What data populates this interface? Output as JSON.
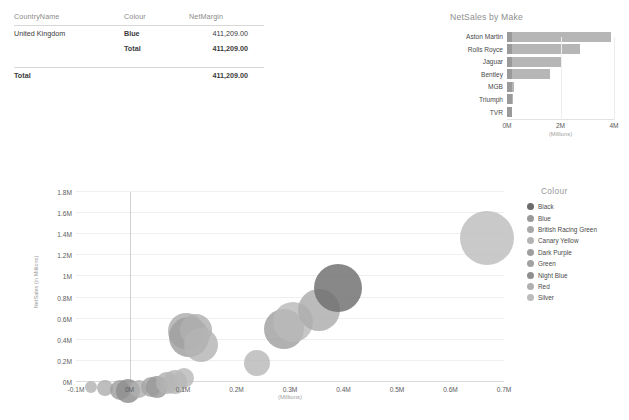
{
  "matrix": {
    "columns": [
      "CountryName",
      "Colour",
      "NetMargin"
    ],
    "rows": [
      {
        "country": "United Kingdom",
        "colour": "Blue",
        "value": "411,209.00",
        "bold": false
      },
      {
        "country": "",
        "colour": "Total",
        "value": "411,209.00",
        "bold": true
      }
    ],
    "grand_total": {
      "label": "Total",
      "value": "411,209.00"
    }
  },
  "bar_card": {
    "title": "NetSales by Make"
  },
  "bubble_card": {
    "x_axis_title": "(Millions)",
    "y_axis_title_line1": "NetSales",
    "y_axis_title_line2": "(in Millions)"
  },
  "legend": {
    "title": "Colour",
    "items": [
      {
        "label": "Black",
        "color": "#6b6b6b"
      },
      {
        "label": "Blue",
        "color": "#9a9a9a"
      },
      {
        "label": "British Racing Green",
        "color": "#a8a8a8"
      },
      {
        "label": "Canary Yellow",
        "color": "#b4b4b4"
      },
      {
        "label": "Dark Purple",
        "color": "#9e9e9e"
      },
      {
        "label": "Green",
        "color": "#a2a2a2"
      },
      {
        "label": "Night Blue",
        "color": "#8f8f8f"
      },
      {
        "label": "Red",
        "color": "#b0b0b0"
      },
      {
        "label": "Silver",
        "color": "#bcbcbc"
      }
    ]
  },
  "chart_data": [
    {
      "type": "bar",
      "title": "NetSales by Make",
      "orientation": "horizontal",
      "categories": [
        "Aston Martin",
        "Rolls Royce",
        "Jaguar",
        "Bentley",
        "MGB",
        "Triumph",
        "TVR"
      ],
      "values": [
        3.9,
        2.72,
        2.0,
        1.62,
        0.26,
        0.24,
        0.2
      ],
      "xlabel": "(Millions)",
      "ylabel": "",
      "xlim": [
        0,
        4
      ],
      "xticks": [
        "0M",
        "2M",
        "4M"
      ],
      "xtick_values": [
        0,
        2,
        4
      ],
      "unit": "Millions",
      "grid": true,
      "bar_color": "#b6b6b6"
    },
    {
      "type": "scatter",
      "title": "",
      "xlabel": "(Millions)",
      "ylabel": "NetSales (in Millions)",
      "xlim": [
        -0.1,
        0.7
      ],
      "ylim": [
        0,
        1.8
      ],
      "xticks": [
        "-0.1M",
        "0M",
        "0.1M",
        "0.2M",
        "0.3M",
        "0.4M",
        "0.5M",
        "0.6M",
        "0.7M"
      ],
      "xtick_values": [
        -0.1,
        0,
        0.1,
        0.2,
        0.3,
        0.4,
        0.5,
        0.6,
        0.7
      ],
      "yticks": [
        "0M",
        "0.2M",
        "0.4M",
        "0.6M",
        "0.8M",
        "1M",
        "1.2M",
        "1.4M",
        "1.6M",
        "1.8M"
      ],
      "ytick_values": [
        0,
        0.2,
        0.4,
        0.6,
        0.8,
        1.0,
        1.2,
        1.4,
        1.6,
        1.8
      ],
      "grid": true,
      "legend_position": "right",
      "points": [
        {
          "x": -0.072,
          "y": 0.012,
          "r": 6,
          "color": "#b3b3b3",
          "series": "Silver"
        },
        {
          "x": -0.045,
          "y": 0.018,
          "r": 8,
          "color": "#aeaeae",
          "series": "Red"
        },
        {
          "x": -0.018,
          "y": 0.02,
          "r": 10,
          "color": "#9d9d9d",
          "series": "Night Blue"
        },
        {
          "x": -0.002,
          "y": 0.024,
          "r": 12,
          "color": "#8d8d8d",
          "series": "Black"
        },
        {
          "x": 0.018,
          "y": 0.022,
          "r": 9,
          "color": "#b0b0b0",
          "series": "Green"
        },
        {
          "x": 0.04,
          "y": 0.048,
          "r": 10,
          "color": "#a6a6a6",
          "series": "Canary Yellow"
        },
        {
          "x": 0.052,
          "y": 0.06,
          "r": 11,
          "color": "#999999",
          "series": "Dark Purple"
        },
        {
          "x": 0.071,
          "y": 0.095,
          "r": 11,
          "color": "#b2b2b2",
          "series": "Blue"
        },
        {
          "x": 0.085,
          "y": 0.118,
          "r": 12,
          "color": "#b5b5b5",
          "series": "British Racing Green"
        },
        {
          "x": 0.101,
          "y": 0.13,
          "r": 10,
          "color": "#b8b8b8",
          "series": "Silver"
        },
        {
          "x": 0.106,
          "y": 0.655,
          "r": 18,
          "color": "#acacac",
          "series": "Canary Yellow"
        },
        {
          "x": 0.112,
          "y": 0.62,
          "r": 20,
          "color": "#9f9f9f",
          "series": "Night Blue"
        },
        {
          "x": 0.124,
          "y": 0.64,
          "r": 16,
          "color": "#b0b0b0",
          "series": "Green"
        },
        {
          "x": 0.133,
          "y": 0.51,
          "r": 17,
          "color": "#b4b4b4",
          "series": "Blue"
        },
        {
          "x": 0.238,
          "y": 0.3,
          "r": 13,
          "color": "#b8b8b8",
          "series": "Silver"
        },
        {
          "x": 0.288,
          "y": 0.695,
          "r": 20,
          "color": "#a0a0a0",
          "series": "Dark Purple"
        },
        {
          "x": 0.305,
          "y": 0.76,
          "r": 20,
          "color": "#b9b9b9",
          "series": "Red"
        },
        {
          "x": 0.355,
          "y": 0.885,
          "r": 21,
          "color": "#acacac",
          "series": "British Racing Green"
        },
        {
          "x": 0.39,
          "y": 1.115,
          "r": 24,
          "color": "#6e6e6e",
          "series": "Black"
        },
        {
          "x": 0.668,
          "y": 1.62,
          "r": 27,
          "color": "#bdbdbd",
          "series": "Silver"
        }
      ]
    }
  ]
}
